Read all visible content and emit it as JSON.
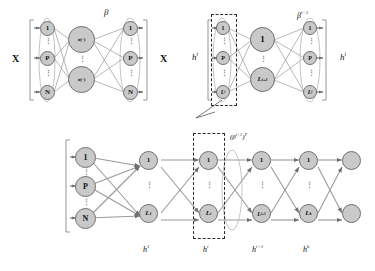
{
  "figure": {
    "type": "neural-network-architecture-diagram"
  },
  "panel_top_left": {
    "name": "autoencoder-input-reconstruction",
    "input_label": "X",
    "output_label": "X",
    "weight_label": "β",
    "input_nodes": [
      {
        "label": "1"
      },
      {
        "label": "P"
      },
      {
        "label": "N"
      }
    ],
    "hidden_nodes": [
      {
        "label": "σ(·)"
      },
      {
        "label": "σ(·)"
      }
    ],
    "output_nodes": [
      {
        "label": "1"
      },
      {
        "label": "P"
      },
      {
        "label": "N"
      }
    ],
    "vertical_dots": "⋮"
  },
  "panel_top_right": {
    "name": "hidden-layer-autoencoder",
    "input_label": "h",
    "input_label_sup": "i",
    "output_label": "h",
    "output_label_sup": "i",
    "weight_label": "β",
    "weight_label_sup": "i+1",
    "input_nodes": [
      {
        "label": "1",
        "sup": ""
      },
      {
        "label": "P",
        "sup": ""
      },
      {
        "label": "L",
        "sup": "i"
      }
    ],
    "hidden_nodes": [
      {
        "label": "1",
        "sup": ""
      },
      {
        "label": "L",
        "sup": "i+1"
      }
    ],
    "output_nodes": [
      {
        "label": "1",
        "sup": ""
      },
      {
        "label": "P",
        "sup": ""
      },
      {
        "label": "L",
        "sup": "i"
      }
    ],
    "vertical_dots": "⋮"
  },
  "panel_bottom": {
    "name": "stacked-deep-network",
    "weight_label": "(β",
    "weight_label_sup": "i+1",
    "weight_label_tail": ")",
    "weight_label_tail_sup": "T",
    "input_nodes": [
      {
        "label": "1"
      },
      {
        "label": "P"
      },
      {
        "label": "N"
      }
    ],
    "layers": [
      {
        "label": "h",
        "label_sup": "1",
        "nodes": [
          {
            "label": "1",
            "sup": ""
          },
          {
            "label": "L",
            "sup": "1"
          }
        ]
      },
      {
        "label": "h",
        "label_sup": "i",
        "nodes": [
          {
            "label": "1",
            "sup": ""
          },
          {
            "label": "L",
            "sup": "i"
          }
        ]
      },
      {
        "label": "h",
        "label_sup": "i+1",
        "nodes": [
          {
            "label": "1",
            "sup": ""
          },
          {
            "label": "L",
            "sup": "i+1"
          }
        ]
      },
      {
        "label": "h",
        "label_sup": "k",
        "nodes": [
          {
            "label": "1",
            "sup": ""
          },
          {
            "label": "L",
            "sup": "k"
          }
        ]
      },
      {
        "label": "",
        "label_sup": "",
        "nodes": [
          {
            "label": "",
            "sup": ""
          },
          {
            "label": "",
            "sup": ""
          }
        ]
      }
    ],
    "vertical_dots": "⋮"
  },
  "colors": {
    "node_fill": "#c9c9c9",
    "node_stroke": "#6f6f6f",
    "edge": "#8a8a8a",
    "box_stroke": "#2b2b2b",
    "text": "#111111",
    "background": "#ffffff"
  }
}
